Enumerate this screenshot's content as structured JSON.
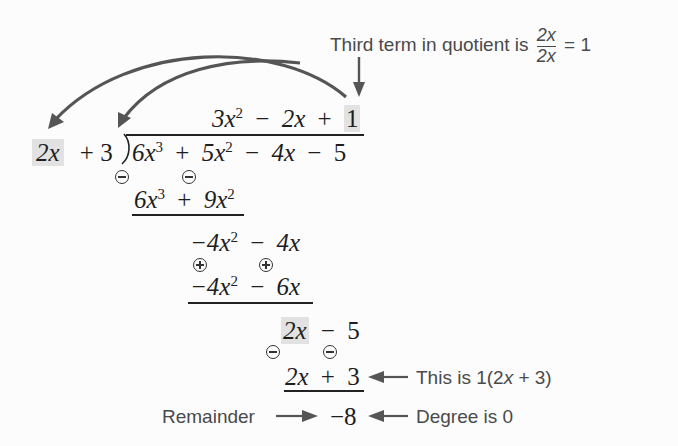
{
  "annotation_top": {
    "prefix": "Third term in quotient is",
    "fraction_numerator": "2x",
    "fraction_denominator": "2x",
    "equals": "= 1"
  },
  "quotient": {
    "t1": "3x",
    "t1_exp": "2",
    "op1": "−",
    "t2": "2x",
    "op2": "+",
    "t3": "1"
  },
  "divisor": {
    "lead": "2x",
    "rest": "+ 3"
  },
  "dividend": {
    "t1": "6x",
    "t1_exp": "3",
    "op1": "+",
    "t2": "5x",
    "t2_exp": "2",
    "op2": "−",
    "t3": "4x",
    "op3": "−",
    "t4": "5"
  },
  "step1_subtract": {
    "t1": "6x",
    "t1_exp": "3",
    "op": "+",
    "t2": "9x",
    "t2_exp": "2",
    "signs": [
      "−",
      "−"
    ]
  },
  "step1_result": {
    "t1": "−4x",
    "t1_exp": "2",
    "op": "−",
    "t2": "4x"
  },
  "step2_subtract": {
    "t1": "−4x",
    "t1_exp": "2",
    "op": "−",
    "t2": "6x",
    "signs": [
      "+",
      "+"
    ]
  },
  "step2_result": {
    "lead": "2x",
    "op": "−",
    "t2": "5"
  },
  "step3_subtract": {
    "t1": "2x",
    "op": "+",
    "t2": "3",
    "signs": [
      "−",
      "−"
    ]
  },
  "note_step3": {
    "prefix": "This is 1(2",
    "var": "x",
    "suffix": " + 3)"
  },
  "remainder": {
    "label": "Remainder",
    "value": "−8",
    "note": "Degree is 0"
  },
  "colors": {
    "highlight": "#e2e2e2",
    "arrow": "#555555",
    "text": "#1e1e1e",
    "note_text": "#4a4a4a"
  }
}
